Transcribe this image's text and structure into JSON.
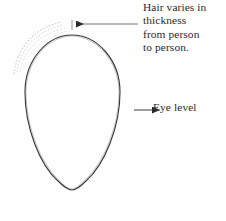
{
  "figure": {
    "background_color": "#fefefe",
    "ink_color": "#2b2b2b",
    "line_color": "#8a8a8a",
    "faint_color": "#c9c9c9"
  },
  "annotations": {
    "hair_note": {
      "name": "hair-varies-note",
      "lines": [
        "Hair varies in",
        "thickness",
        "from person",
        "to person."
      ]
    },
    "eye_level": {
      "name": "eye-level-label",
      "text": "Eye level"
    }
  },
  "drawing": {
    "egg": {
      "description": "inverted egg head outline",
      "center_x": 72,
      "top_y": 35,
      "bottom_y": 190,
      "left_x": 25,
      "right_x": 120,
      "widest_y": 95
    },
    "eye_level_line": {
      "y": 110,
      "x_start": 24,
      "x_end": 140
    },
    "center_line": {
      "x": 72,
      "y_start": 18,
      "y_end": 213
    },
    "measure_line_top": {
      "y": 24,
      "x_start": 75,
      "x_end": 138
    },
    "measure_line_vertical": {
      "x": 138,
      "y_start": 24,
      "y_end": 198
    },
    "chin_baseline": {
      "y": 188,
      "x_start": 72,
      "x_end": 160
    },
    "hair_arcs_count": 4
  }
}
